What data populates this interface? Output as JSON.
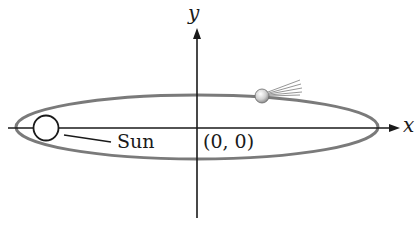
{
  "diagram": {
    "type": "orbit",
    "axes": {
      "x_label": "x",
      "y_label": "y"
    },
    "labels": {
      "sun": "Sun",
      "origin": "(0, 0)"
    },
    "elements": {
      "ellipse": {
        "cx": 197,
        "cy": 127,
        "rx": 181,
        "ry": 32,
        "stroke": "#7a7a7a"
      },
      "sun": {
        "cx": 46,
        "cy": 128,
        "r": 12
      },
      "comet": {
        "cx": 262,
        "cy": 96,
        "r": 7
      }
    },
    "colors": {
      "axis": "#1a1a1a",
      "ellipse": "#7a7a7a",
      "sun_fill": "#ffffff",
      "comet_fill": "#d8d8d8"
    }
  }
}
